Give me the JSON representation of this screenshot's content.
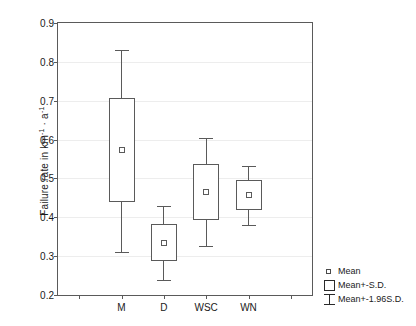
{
  "chart_data": {
    "type": "box",
    "title": "",
    "xlabel": "",
    "ylabel": "Failure rate in km-1 · a-1",
    "ylabel_parts": {
      "prefix": "Failure rate in km",
      "sup1": "-1",
      "middot": " · a",
      "sup2": "-1"
    },
    "categories": [
      "M",
      "D",
      "WSC",
      "WN"
    ],
    "ylim": [
      0.2,
      0.9
    ],
    "yticks": [
      0.2,
      0.3,
      0.4,
      0.5,
      0.6,
      0.7,
      0.8,
      0.9
    ],
    "ytick_labels": [
      "0.2",
      "0.3",
      "0.4",
      "0.5",
      "0.6",
      "0.7",
      "0.8",
      "0.9"
    ],
    "grid": true,
    "legend_position": "bottom-right-outside",
    "series": [
      {
        "name": "M",
        "mean": 0.573,
        "sd_low": 0.439,
        "sd_high": 0.707,
        "ci_low": 0.311,
        "ci_high": 0.831
      },
      {
        "name": "D",
        "mean": 0.335,
        "sd_low": 0.288,
        "sd_high": 0.382,
        "ci_low": 0.239,
        "ci_high": 0.429
      },
      {
        "name": "WSC",
        "mean": 0.465,
        "sd_low": 0.394,
        "sd_high": 0.536,
        "ci_low": 0.326,
        "ci_high": 0.605
      },
      {
        "name": "WN",
        "mean": 0.458,
        "sd_low": 0.418,
        "sd_high": 0.495,
        "ci_low": 0.381,
        "ci_high": 0.531
      }
    ],
    "legend": [
      {
        "key": "mean-marker",
        "label": "Mean"
      },
      {
        "key": "sd-box",
        "label": "Mean+-S.D."
      },
      {
        "key": "ci-whisker",
        "label": "Mean+-1.96S.D."
      }
    ],
    "colors": {
      "line": "#5a5a5a",
      "grid": "#ededed",
      "background": "#ffffff",
      "text": "#1a1a1a"
    }
  }
}
